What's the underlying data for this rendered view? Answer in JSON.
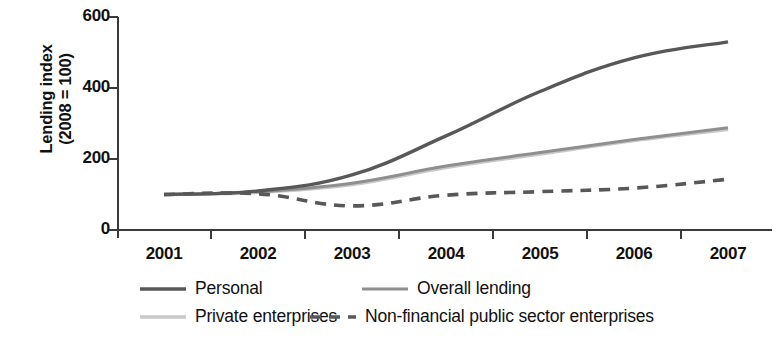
{
  "chart_data": {
    "type": "line",
    "title": "",
    "xlabel": "",
    "ylabel": "Lending index\n(2008 = 100)",
    "x": [
      2001,
      2002,
      2003,
      2004,
      2005,
      2006,
      2007
    ],
    "xtick_labels": [
      "2001",
      "2002",
      "2003",
      "2004",
      "2005",
      "2006",
      "2007"
    ],
    "ytick_labels": [
      "0",
      "200",
      "400",
      "600"
    ],
    "ytick_values": [
      0,
      200,
      400,
      600
    ],
    "ylim": [
      0,
      600
    ],
    "xlim": [
      2001,
      2007
    ],
    "grid": false,
    "legend_position": "below-left",
    "series": [
      {
        "name": "Personal",
        "values": [
          100,
          110,
          155,
          265,
          390,
          485,
          530
        ],
        "color": "#585858",
        "style": "solid",
        "width": 3.4
      },
      {
        "name": "Overall lending",
        "values": [
          100,
          108,
          132,
          180,
          218,
          255,
          288
        ],
        "color": "#8f8f8f",
        "style": "solid",
        "width": 3.0
      },
      {
        "name": "Private enterprises",
        "values": [
          100,
          106,
          128,
          176,
          214,
          252,
          283
        ],
        "color": "#c9c9c9",
        "style": "solid",
        "width": 3.4
      },
      {
        "name": "Non-financial public sector enterprises",
        "values": [
          100,
          102,
          68,
          98,
          108,
          118,
          143
        ],
        "color": "#585858",
        "style": "dashed",
        "width": 3.6
      }
    ]
  },
  "legend": {
    "entries": [
      {
        "label": "Personal"
      },
      {
        "label": "Overall lending"
      },
      {
        "label": "Private enterprises"
      },
      {
        "label": "Non-financial public sector enterprises"
      }
    ]
  },
  "axes": {
    "axis_color": "#3a3a3a"
  }
}
